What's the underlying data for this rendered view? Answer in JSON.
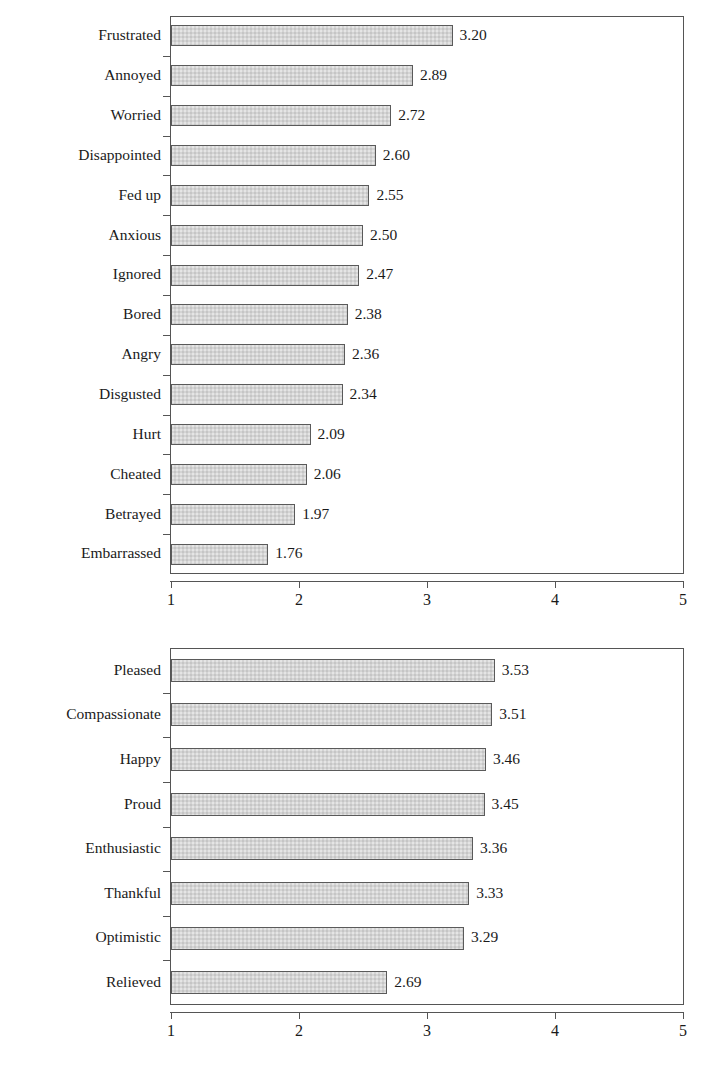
{
  "figure": {
    "width": 710,
    "height": 1065,
    "background": "#ffffff",
    "bar_fill": "#d4d4d4",
    "bar_border": "#5a5a5a",
    "axis_color": "#555555",
    "text_color": "#1a1a1a"
  },
  "chart_data": [
    {
      "type": "bar",
      "orientation": "horizontal",
      "title": "",
      "subtitle": "",
      "xlabel": "",
      "ylabel": "",
      "xlim": [
        1,
        5
      ],
      "xticks": [
        1,
        2,
        3,
        4,
        5
      ],
      "xtick_labels": [
        "1",
        "2",
        "3",
        "4",
        "5"
      ],
      "grid": false,
      "legend": null,
      "data_labels": true,
      "data_label_format": "0.00",
      "categories": [
        "Frustrated",
        "Annoyed",
        "Worried",
        "Disappointed",
        "Fed up",
        "Anxious",
        "Ignored",
        "Bored",
        "Angry",
        "Disgusted",
        "Hurt",
        "Cheated",
        "Betrayed",
        "Embarrassed"
      ],
      "values": [
        3.2,
        2.89,
        2.72,
        2.6,
        2.55,
        2.5,
        2.47,
        2.38,
        2.36,
        2.34,
        2.09,
        2.06,
        1.97,
        1.76
      ],
      "value_labels": [
        "3.20",
        "2.89",
        "2.72",
        "2.60",
        "2.55",
        "2.50",
        "2.47",
        "2.38",
        "2.36",
        "2.34",
        "2.09",
        "2.06",
        "1.97",
        "1.76"
      ]
    },
    {
      "type": "bar",
      "orientation": "horizontal",
      "title": "",
      "subtitle": "",
      "xlabel": "",
      "ylabel": "",
      "xlim": [
        1,
        5
      ],
      "xticks": [
        1,
        2,
        3,
        4,
        5
      ],
      "xtick_labels": [
        "1",
        "2",
        "3",
        "4",
        "5"
      ],
      "grid": false,
      "legend": null,
      "data_labels": true,
      "data_label_format": "0.00",
      "categories": [
        "Pleased",
        "Compassionate",
        "Happy",
        "Proud",
        "Enthusiastic",
        "Thankful",
        "Optimistic",
        "Relieved"
      ],
      "values": [
        3.53,
        3.51,
        3.46,
        3.45,
        3.36,
        3.33,
        3.29,
        2.69
      ],
      "value_labels": [
        "3.53",
        "3.51",
        "3.46",
        "3.45",
        "3.36",
        "3.33",
        "3.29",
        "2.69"
      ]
    }
  ]
}
